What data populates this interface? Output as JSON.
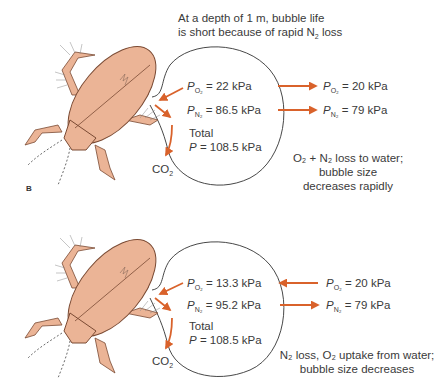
{
  "colors": {
    "beetle_fill": "#EBB496",
    "beetle_outline": "#7A4A33",
    "arrow": "#D9622B",
    "bubble_outline": "#333333",
    "text": "#3a3a3a"
  },
  "panels": [
    {
      "label": "B",
      "heading_line1": "At a depth of 1 m, bubble life",
      "heading_line2_pre": "is short because of rapid N",
      "heading_line2_sub": "2",
      "heading_line2_post": " loss",
      "bubble": {
        "po2": {
          "sym": "P",
          "sub": "O2",
          "value": "= 22 kPa"
        },
        "pn2": {
          "sym": "P",
          "sub": "N2",
          "value": "= 86.5 kPa"
        },
        "total_label": "Total",
        "total": {
          "sym": "P",
          "value": "= 108.5 kPa"
        }
      },
      "water": {
        "po2": {
          "sym": "P",
          "sub": "O2",
          "value": "= 20 kPa"
        },
        "pn2": {
          "sym": "P",
          "sub": "N2",
          "value": "= 79 kPa"
        }
      },
      "arrows": {
        "o2_direction": "out",
        "n2_direction": "out"
      },
      "co2_label": "CO",
      "co2_sub": "2",
      "note_line1": "O₂ + N₂ loss to water;",
      "note_line2": "bubble size",
      "note_line3": "decreases rapidly"
    },
    {
      "label": "",
      "bubble": {
        "po2": {
          "sym": "P",
          "sub": "O2",
          "value": "= 13.3 kPa"
        },
        "pn2": {
          "sym": "P",
          "sub": "N2",
          "value": "= 95.2 kPa"
        },
        "total_label": "Total",
        "total": {
          "sym": "P",
          "value": "= 108.5 kPa"
        }
      },
      "water": {
        "po2": {
          "sym": "P",
          "sub": "O2",
          "value": "= 20 kPa"
        },
        "pn2": {
          "sym": "P",
          "sub": "N2",
          "value": "= 79 kPa"
        }
      },
      "arrows": {
        "o2_direction": "in",
        "n2_direction": "out"
      },
      "co2_label": "CO",
      "co2_sub": "2",
      "note_line1": "N₂ loss, O₂ uptake from water;",
      "note_line2": "bubble size decreases"
    }
  ]
}
